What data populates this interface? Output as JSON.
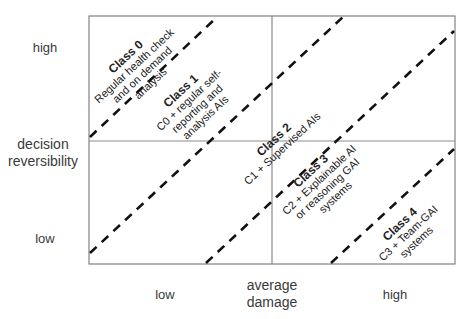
{
  "y_axis": {
    "label_line1": "decision",
    "label_line2": "reversibility",
    "high": "high",
    "low": "low"
  },
  "x_axis": {
    "label_line1": "average",
    "label_line2": "damage",
    "low": "low",
    "high": "high"
  },
  "classes": [
    {
      "title": "Class 0",
      "line1": "Regular health check",
      "line2": "and on demand",
      "line3": "analysis"
    },
    {
      "title": "Class 1",
      "line1": "C0 + regular self-",
      "line2": "reporting and",
      "line3": "analysis AIs"
    },
    {
      "title": "Class 2",
      "line1": "C1 + Supervised AIs"
    },
    {
      "title": "Class 3",
      "line1": "C2 + Explainable AI",
      "line2": "or reasoning GAI",
      "line3": "systems"
    },
    {
      "title": "Class 4",
      "line1": "C3 + Team-GAI",
      "line2": "systems"
    }
  ],
  "colors": {
    "frame": "#8c8c8c",
    "dash": "#111111",
    "text": "#333333"
  }
}
